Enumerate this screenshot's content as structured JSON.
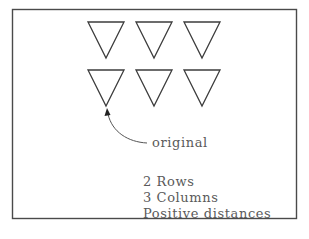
{
  "diagram": {
    "title": "",
    "grid": {
      "rows": 2,
      "columns": 3,
      "shape": "inverted-triangle"
    },
    "callout": {
      "label": "original",
      "target": "row 2, column 1 (bottom-left triangle)"
    },
    "notes": [
      "2 Rows",
      "3 Columns",
      "Positive distances"
    ],
    "colors": {
      "stroke": "#3c3c3c",
      "text": "#5a5a5a",
      "background": "#ffffff"
    }
  }
}
